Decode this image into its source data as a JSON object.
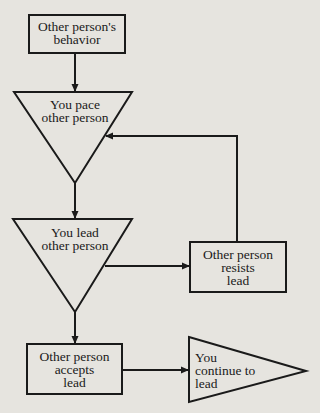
{
  "diagram": {
    "type": "flowchart",
    "colors": {
      "background": "#e6e4df",
      "stroke": "#1a1a1a"
    },
    "nodes": [
      {
        "id": "behavior",
        "shape": "rectangle",
        "label": "Other person's\nbehavior"
      },
      {
        "id": "pace",
        "shape": "inverted-triangle",
        "label": "You pace\nother person"
      },
      {
        "id": "lead",
        "shape": "inverted-triangle",
        "label": "You lead\nother person"
      },
      {
        "id": "resists",
        "shape": "rectangle",
        "label": "Other person\nresists\nlead"
      },
      {
        "id": "accepts",
        "shape": "rectangle",
        "label": "Other person\naccepts\nlead"
      },
      {
        "id": "continue",
        "shape": "right-triangle",
        "label": "You\ncontinue to\nlead"
      }
    ],
    "edges": [
      {
        "from": "behavior",
        "to": "pace"
      },
      {
        "from": "pace",
        "to": "lead"
      },
      {
        "from": "lead",
        "to": "resists"
      },
      {
        "from": "resists",
        "to": "pace"
      },
      {
        "from": "lead",
        "to": "accepts"
      },
      {
        "from": "accepts",
        "to": "continue"
      }
    ]
  }
}
